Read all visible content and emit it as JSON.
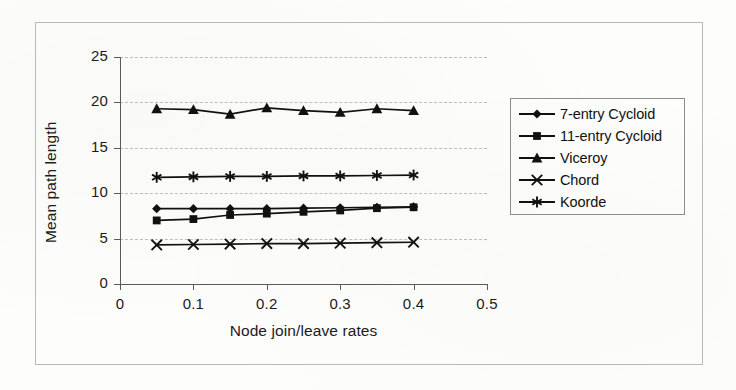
{
  "figure": {
    "caption_present": false
  },
  "chart_data": {
    "type": "line",
    "title": "",
    "subtitle": "",
    "xlabel": "Node join/leave rates",
    "ylabel": "Mean path length",
    "xlim": [
      0,
      0.5
    ],
    "ylim": [
      0,
      25
    ],
    "xticks": [
      "0",
      "0.1",
      "0.2",
      "0.3",
      "0.4",
      "0.5"
    ],
    "xtick_values": [
      0,
      0.1,
      0.2,
      0.3,
      0.4,
      0.5
    ],
    "yticks": [
      "0",
      "5",
      "10",
      "15",
      "20",
      "25"
    ],
    "ytick_values": [
      0,
      5,
      10,
      15,
      20,
      25
    ],
    "grid": "horizontal-dashed",
    "legend_position": "right-outside",
    "x": [
      0.05,
      0.1,
      0.15,
      0.2,
      0.25,
      0.3,
      0.35,
      0.4
    ],
    "series": [
      {
        "name": "7-entry Cycloid",
        "marker": "diamond",
        "values": [
          8.3,
          8.3,
          8.3,
          8.3,
          8.35,
          8.4,
          8.45,
          8.5
        ]
      },
      {
        "name": "11-entry Cycloid",
        "marker": "square",
        "values": [
          7.0,
          7.15,
          7.6,
          7.75,
          7.95,
          8.1,
          8.35,
          8.45
        ]
      },
      {
        "name": "Viceroy",
        "marker": "triangle",
        "values": [
          19.3,
          19.2,
          18.7,
          19.4,
          19.1,
          18.9,
          19.3,
          19.1
        ]
      },
      {
        "name": "Chord",
        "marker": "cross",
        "values": [
          4.3,
          4.35,
          4.4,
          4.45,
          4.45,
          4.5,
          4.55,
          4.6
        ]
      },
      {
        "name": "Koorde",
        "marker": "asterisk",
        "values": [
          11.75,
          11.8,
          11.85,
          11.85,
          11.9,
          11.9,
          11.95,
          12.0
        ]
      }
    ],
    "colors": {
      "series": "#111111",
      "grid": "#bdbdbd",
      "axis": "#5a5a5a",
      "background": "#fdfdfc"
    }
  },
  "legend": {
    "entries": [
      {
        "label": "7-entry Cycloid",
        "marker": "diamond"
      },
      {
        "label": "11-entry Cycloid",
        "marker": "square"
      },
      {
        "label": "Viceroy",
        "marker": "triangle"
      },
      {
        "label": "Chord",
        "marker": "cross"
      },
      {
        "label": "Koorde",
        "marker": "asterisk"
      }
    ]
  }
}
